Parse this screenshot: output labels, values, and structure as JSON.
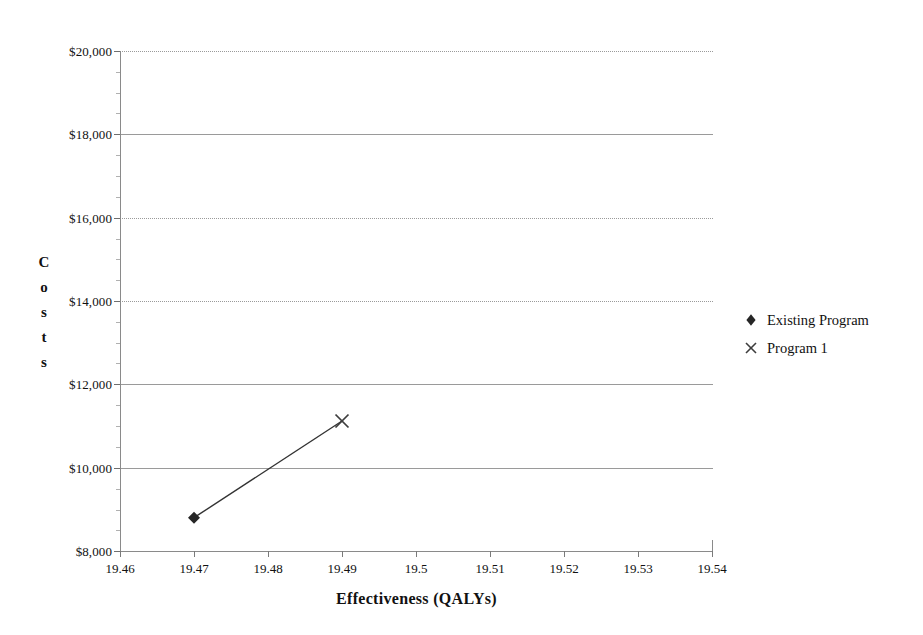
{
  "chart_data": {
    "type": "scatter",
    "title": "",
    "xlabel": "Effectiveness (QALYs)",
    "ylabel": "Costs",
    "ylabel_letters": [
      "C",
      "o",
      "s",
      "t",
      "s"
    ],
    "xlim": [
      19.46,
      19.54
    ],
    "ylim": [
      8000,
      20000
    ],
    "x_ticks": [
      19.46,
      19.47,
      19.48,
      19.49,
      19.5,
      19.51,
      19.52,
      19.53,
      19.54
    ],
    "x_tick_labels": [
      "19.46",
      "19.47",
      "19.48",
      "19.49",
      "19.5",
      "19.51",
      "19.52",
      "19.53",
      "19.54"
    ],
    "y_ticks": [
      8000,
      10000,
      12000,
      14000,
      16000,
      18000,
      20000
    ],
    "y_tick_labels": [
      "$8,000",
      "$10,000",
      "$12,000",
      "$14,000",
      "$16,000",
      "$18,000",
      "$20,000"
    ],
    "grid": true,
    "grid_styles": {
      "8000": "solid",
      "10000": "solid",
      "12000": "solid",
      "14000": "dotted",
      "16000": "dotted",
      "18000": "solid",
      "20000": "dotted"
    },
    "legend_position": "right",
    "connector_line": {
      "from": [
        19.47,
        8800
      ],
      "to": [
        19.49,
        11120
      ],
      "color": "#333333"
    },
    "series": [
      {
        "name": "Existing Program",
        "marker": "diamond",
        "color": "#262626",
        "points": [
          {
            "x": 19.47,
            "y": 8800
          }
        ]
      },
      {
        "name": "Program 1",
        "marker": "x",
        "color": "#3d3d3d",
        "points": [
          {
            "x": 19.49,
            "y": 11120
          }
        ]
      }
    ]
  },
  "legend": {
    "items": [
      {
        "label": "Existing Program",
        "marker": "diamond"
      },
      {
        "label": "Program 1",
        "marker": "x"
      }
    ]
  },
  "colors": {
    "axis": "#8a8a8a",
    "gridline": "#9a9a9a",
    "marker_diamond": "#262626",
    "marker_x": "#3d3d3d",
    "connector": "#333333",
    "text": "#111111",
    "background": "#ffffff"
  }
}
